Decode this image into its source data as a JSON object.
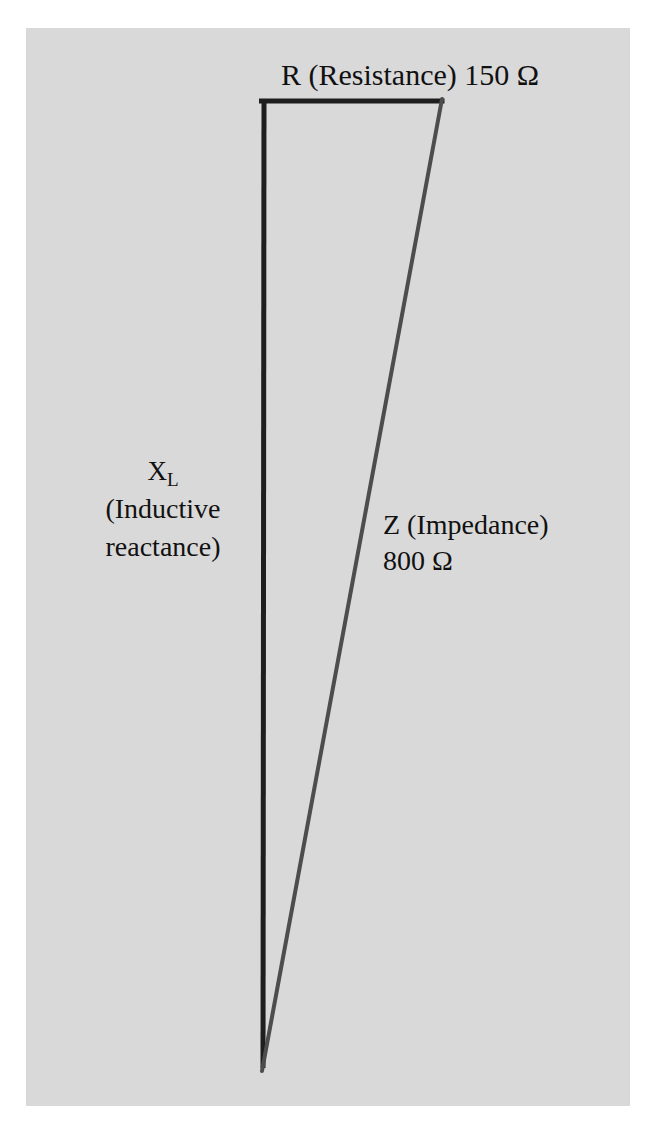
{
  "diagram": {
    "background_color": "#d9d9d9",
    "page_color": "#ffffff",
    "triangle": {
      "vertices": {
        "top_left": [
          264,
          101
        ],
        "top_right": [
          442,
          101
        ],
        "bottom": [
          263,
          1070
        ]
      },
      "sides": {
        "resistance": {
          "color": "#1e1e1e",
          "width": 5
        },
        "reactance": {
          "color": "#1e1e1e",
          "width": 5
        },
        "impedance": {
          "color": "#4d4d4d",
          "width": 4
        }
      }
    },
    "labels": {
      "resistance": {
        "text": "R (Resistance) 150 Ω",
        "symbol": "R",
        "name": "Resistance",
        "value": "150",
        "unit": "Ω"
      },
      "reactance": {
        "symbol": "X",
        "subscript": "L",
        "line1": "(Inductive",
        "line2": "reactance)"
      },
      "impedance": {
        "line1": "Z (Impedance)",
        "line2": "800 Ω",
        "symbol": "Z",
        "name": "Impedance",
        "value": "800",
        "unit": "Ω"
      }
    }
  }
}
